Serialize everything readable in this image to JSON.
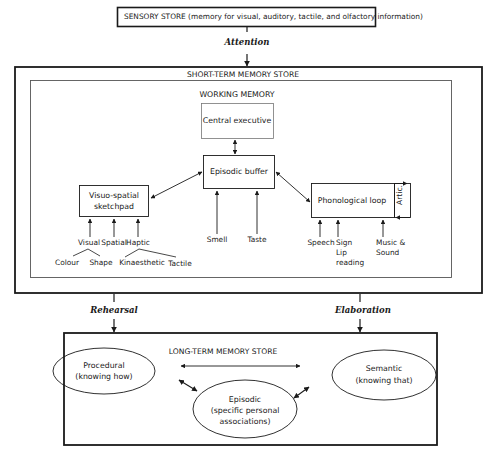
{
  "sensory_store": {
    "label": "SENSORY STORE (memory for visual, auditory, tactile, and olfactory information)"
  },
  "arrows": {
    "attention": "Attention",
    "rehearsal": "Rehearsal",
    "elaboration": "Elaboration"
  },
  "short_term_store": {
    "title": "SHORT-TERM MEMORY STORE",
    "working_memory": {
      "title": "WORKING MEMORY",
      "central_executive": "Central executive",
      "episodic_buffer": "Episodic buffer",
      "visuo_spatial": {
        "line1": "Visuo-spatial",
        "line2": "sketchpad"
      },
      "phonological_loop": "Phonological loop",
      "artic": "Artic.",
      "episodic_inputs": [
        "Smell",
        "Taste"
      ],
      "visuo_inputs": {
        "visual": "Visual",
        "spatial": "Spatial",
        "haptic": "Haptic",
        "colour": "Colour",
        "shape": "Shape",
        "kinaesthetic": "Kinaesthetic",
        "tactile": "Tactile"
      },
      "phonological_inputs": {
        "speech": "Speech",
        "sign": "Sign",
        "lip": "Lip",
        "reading": "reading",
        "music": "Music & ",
        "sound": "Sound"
      }
    }
  },
  "long_term_store": {
    "title": "LONG-TERM MEMORY STORE",
    "procedural": {
      "name": "Procedural",
      "desc": "(knowing how)"
    },
    "semantic": {
      "name": "Semantic",
      "desc": "(knowing that)"
    },
    "episodic": {
      "name": "Episodic",
      "desc1": "(specific personal",
      "desc2": "associations)"
    }
  }
}
